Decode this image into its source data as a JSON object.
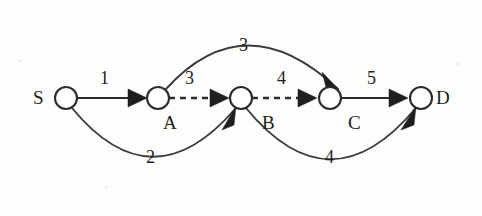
{
  "diagram": {
    "type": "directed-weighted-graph",
    "background_color": "#fdfdfc",
    "stroke_color": "#2b2b2b",
    "nodes": [
      {
        "id": "S",
        "label": "S",
        "cx": 66,
        "cy": 98,
        "r": 11,
        "label_x": 33,
        "label_y": 88
      },
      {
        "id": "A",
        "label": "A",
        "cx": 158,
        "cy": 98,
        "r": 11,
        "label_x": 163,
        "label_y": 113
      },
      {
        "id": "B",
        "label": "B",
        "cx": 241,
        "cy": 98,
        "r": 11,
        "label_x": 262,
        "label_y": 113
      },
      {
        "id": "C",
        "label": "C",
        "cx": 330,
        "cy": 98,
        "r": 11,
        "label_x": 348,
        "label_y": 113
      },
      {
        "id": "D",
        "label": "D",
        "cx": 421,
        "cy": 98,
        "r": 11,
        "label_x": 436,
        "label_y": 88
      }
    ],
    "edges": [
      {
        "id": "S-A",
        "from": "S",
        "to": "A",
        "weight": "1",
        "style": "solid",
        "shape": "straight",
        "label_x": 100,
        "label_y": 69
      },
      {
        "id": "A-B",
        "from": "A",
        "to": "B",
        "weight": "3",
        "style": "dashed",
        "shape": "straight",
        "label_x": 185,
        "label_y": 69
      },
      {
        "id": "B-C",
        "from": "B",
        "to": "C",
        "weight": "4",
        "style": "dashed",
        "shape": "straight",
        "label_x": 277,
        "label_y": 69
      },
      {
        "id": "C-D",
        "from": "C",
        "to": "D",
        "weight": "5",
        "style": "solid",
        "shape": "straight",
        "label_x": 367,
        "label_y": 69
      },
      {
        "id": "A-C",
        "from": "A",
        "to": "C",
        "weight": "3",
        "style": "solid",
        "shape": "arc-above",
        "label_x": 239,
        "label_y": 36
      },
      {
        "id": "S-B",
        "from": "S",
        "to": "B",
        "weight": "2",
        "style": "solid",
        "shape": "arc-below",
        "label_x": 146,
        "label_y": 148
      },
      {
        "id": "B-D",
        "from": "B",
        "to": "D",
        "weight": "4",
        "style": "solid",
        "shape": "arc-below",
        "label_x": 325,
        "label_y": 148
      }
    ]
  }
}
